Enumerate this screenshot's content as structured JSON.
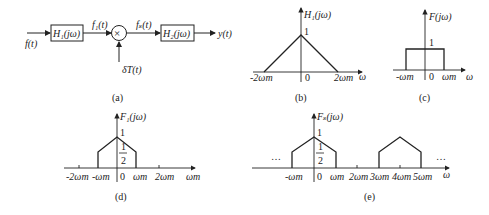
{
  "panel_a": {
    "input": "f(t)",
    "block1": "H₁(jω)",
    "mid1": "f₁(t)",
    "mult": "×",
    "mid2": "fₛ(t)",
    "block2": "H₂(jω)",
    "output": "y(t)",
    "sampler": "δT(t)",
    "caption": "(a)"
  },
  "panel_b": {
    "title": "H₁(jω)",
    "peak": "1",
    "ticks": [
      "-2ωm",
      "0",
      "2ωm"
    ],
    "axis": "ω",
    "caption": "(b)"
  },
  "panel_c": {
    "title": "F(jω)",
    "peak": "1",
    "ticks": [
      "-ωm",
      "0",
      "ωm"
    ],
    "axis": "ω",
    "caption": "(c)"
  },
  "panel_d": {
    "title": "F₁(jω)",
    "peak": "1",
    "half_num": "1",
    "half_den": "2",
    "ticks": [
      "-2ωm",
      "-ωm",
      "0",
      "ωm",
      "2ωm"
    ],
    "axis": "ωm",
    "caption": "(d)"
  },
  "panel_e": {
    "title": "Fₛ(jω)",
    "peak": "1",
    "half_num": "1",
    "half_den": "2",
    "ticks": [
      "-ωm",
      "0",
      "ωm",
      "2ωm",
      "3ωm",
      "4ωm",
      "5ωm"
    ],
    "axis": "ω",
    "dots_left": "…",
    "dots_right": "…",
    "caption": "(e)"
  }
}
